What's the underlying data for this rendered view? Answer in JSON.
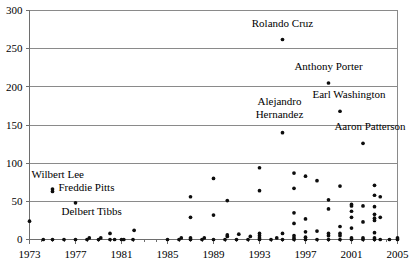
{
  "chart_data": {
    "type": "scatter",
    "title": "",
    "subtitle": "",
    "xlabel": "",
    "ylabel": "",
    "xlim": [
      1973,
      2005
    ],
    "ylim": [
      0,
      300
    ],
    "grid": true,
    "legend": false,
    "legend_position": "none",
    "x_ticks": [
      "1973",
      "1977",
      "1981",
      "1985",
      "1989",
      "1993",
      "1997",
      "2001",
      "2005"
    ],
    "x_tick_values": [
      1973,
      1977,
      1981,
      1985,
      1989,
      1993,
      1997,
      2001,
      2005
    ],
    "y_ticks": [
      "0",
      "50",
      "100",
      "150",
      "200",
      "250",
      "300"
    ],
    "y_tick_values": [
      0,
      50,
      100,
      150,
      200,
      250,
      300
    ],
    "marker": "filled-circle",
    "marker_color": "#0d0d0d",
    "points": [
      [
        1973.0,
        24
      ],
      [
        1974.2,
        0
      ],
      [
        1975.0,
        0
      ],
      [
        1975.0,
        63
      ],
      [
        1975.0,
        66
      ],
      [
        1976.0,
        0
      ],
      [
        1977.0,
        0
      ],
      [
        1977.0,
        48
      ],
      [
        1978.0,
        0
      ],
      [
        1978.2,
        2
      ],
      [
        1979.0,
        0
      ],
      [
        1979.2,
        2
      ],
      [
        1980.0,
        0
      ],
      [
        1980.0,
        8
      ],
      [
        1980.4,
        0
      ],
      [
        1981.0,
        0
      ],
      [
        1981.2,
        0
      ],
      [
        1982.0,
        0
      ],
      [
        1982.1,
        12
      ],
      [
        1985.0,
        0
      ],
      [
        1986.0,
        0
      ],
      [
        1986.2,
        2
      ],
      [
        1987.0,
        0
      ],
      [
        1987.0,
        2
      ],
      [
        1987.0,
        29
      ],
      [
        1987.0,
        56
      ],
      [
        1988.0,
        0
      ],
      [
        1988.2,
        2
      ],
      [
        1989.0,
        0
      ],
      [
        1989.0,
        32
      ],
      [
        1989.0,
        80
      ],
      [
        1990.0,
        0
      ],
      [
        1990.2,
        4
      ],
      [
        1990.2,
        6
      ],
      [
        1990.2,
        51
      ],
      [
        1991.0,
        0
      ],
      [
        1991.2,
        7
      ],
      [
        1992.0,
        0
      ],
      [
        1992.2,
        4
      ],
      [
        1993.0,
        0
      ],
      [
        1993.0,
        2
      ],
      [
        1993.0,
        5
      ],
      [
        1993.0,
        8
      ],
      [
        1993.0,
        64
      ],
      [
        1993.0,
        94
      ],
      [
        1994.0,
        0
      ],
      [
        1994.5,
        2
      ],
      [
        1995.0,
        0
      ],
      [
        1995.0,
        8
      ],
      [
        1995.0,
        140
      ],
      [
        1995.0,
        262
      ],
      [
        1996.0,
        0
      ],
      [
        1996.0,
        2
      ],
      [
        1996.0,
        5
      ],
      [
        1996.0,
        21
      ],
      [
        1996.0,
        35
      ],
      [
        1996.0,
        67
      ],
      [
        1996.0,
        87
      ],
      [
        1997.0,
        0
      ],
      [
        1997.0,
        3
      ],
      [
        1997.0,
        10
      ],
      [
        1997.0,
        27
      ],
      [
        1997.0,
        83
      ],
      [
        1998.0,
        0
      ],
      [
        1998.0,
        11
      ],
      [
        1998.0,
        77
      ],
      [
        1999.0,
        0
      ],
      [
        1999.0,
        5
      ],
      [
        1999.0,
        8
      ],
      [
        1999.0,
        40
      ],
      [
        1999.0,
        52
      ],
      [
        1999.0,
        205
      ],
      [
        2000.0,
        0
      ],
      [
        2000.0,
        5
      ],
      [
        2000.0,
        8
      ],
      [
        2000.0,
        17
      ],
      [
        2000.0,
        70
      ],
      [
        2000.0,
        168
      ],
      [
        2001.0,
        0
      ],
      [
        2001.0,
        2
      ],
      [
        2001.0,
        15
      ],
      [
        2001.0,
        29
      ],
      [
        2001.0,
        37
      ],
      [
        2001.0,
        44
      ],
      [
        2001.0,
        46
      ],
      [
        2002.0,
        0
      ],
      [
        2002.0,
        2
      ],
      [
        2002.0,
        23
      ],
      [
        2002.0,
        44
      ],
      [
        2002.0,
        126
      ],
      [
        2003.0,
        0
      ],
      [
        2003.0,
        2
      ],
      [
        2003.0,
        9
      ],
      [
        2003.0,
        25
      ],
      [
        2003.0,
        28
      ],
      [
        2003.0,
        33
      ],
      [
        2003.0,
        43
      ],
      [
        2003.0,
        58
      ],
      [
        2003.0,
        71
      ],
      [
        2003.5,
        0
      ],
      [
        2003.5,
        29
      ],
      [
        2003.5,
        56
      ],
      [
        2004.3,
        0
      ],
      [
        2005.0,
        0
      ],
      [
        2005.0,
        2
      ]
    ],
    "annotations": [
      {
        "label": "Rolando Cruz",
        "lines": [
          "Rolando Cruz"
        ],
        "point": [
          1995.0,
          262
        ],
        "align": "center"
      },
      {
        "label": "Anthony Porter",
        "lines": [
          "Anthony Porter"
        ],
        "point": [
          1999.0,
          205
        ],
        "align": "center"
      },
      {
        "label": "Earl Washington",
        "lines": [
          "Earl Washington"
        ],
        "point": [
          2000.0,
          168
        ],
        "align": "center"
      },
      {
        "label": "Alejandro Hernandez",
        "lines": [
          "Alejandro",
          "Hernandez"
        ],
        "point": [
          1995.0,
          140
        ],
        "align": "center"
      },
      {
        "label": "Aaron Patterson",
        "lines": [
          "Aaron Patterson"
        ],
        "point": [
          2002.0,
          126
        ],
        "align": "center"
      },
      {
        "label": "Wilbert Lee",
        "lines": [
          "Wilbert Lee"
        ],
        "point": [
          1975.0,
          66
        ],
        "align": "left"
      },
      {
        "label": "Freddie Pitts",
        "lines": [
          "Freddie Pitts"
        ],
        "point": [
          1975.0,
          63
        ],
        "align": "left"
      },
      {
        "label": "Delbert Tibbs",
        "lines": [
          "Delbert Tibbs"
        ],
        "point": [
          1977.0,
          48
        ],
        "align": "left"
      }
    ]
  }
}
